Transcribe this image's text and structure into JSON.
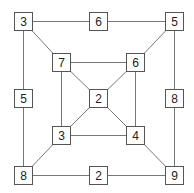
{
  "diagram": {
    "type": "number-graph",
    "line_color": "#777777",
    "nodes": [
      {
        "id": "outer-tl",
        "label": "3",
        "x": 14,
        "y": 12
      },
      {
        "id": "outer-top",
        "label": "6",
        "x": 89,
        "y": 12
      },
      {
        "id": "outer-tr",
        "label": "5",
        "x": 165,
        "y": 12
      },
      {
        "id": "inner-tl",
        "label": "7",
        "x": 52,
        "y": 53
      },
      {
        "id": "inner-tr",
        "label": "6",
        "x": 126,
        "y": 53
      },
      {
        "id": "outer-left",
        "label": "5",
        "x": 14,
        "y": 89
      },
      {
        "id": "center",
        "label": "2",
        "x": 89,
        "y": 89
      },
      {
        "id": "outer-right",
        "label": "8",
        "x": 165,
        "y": 89
      },
      {
        "id": "inner-bl",
        "label": "3",
        "x": 52,
        "y": 126
      },
      {
        "id": "inner-br",
        "label": "4",
        "x": 126,
        "y": 126
      },
      {
        "id": "outer-bl",
        "label": "8",
        "x": 14,
        "y": 166
      },
      {
        "id": "outer-bottom",
        "label": "2",
        "x": 89,
        "y": 166
      },
      {
        "id": "outer-br",
        "label": "9",
        "x": 165,
        "y": 166
      }
    ],
    "edges": [
      [
        "outer-tl",
        "outer-top"
      ],
      [
        "outer-top",
        "outer-tr"
      ],
      [
        "outer-tl",
        "outer-left"
      ],
      [
        "outer-left",
        "outer-bl"
      ],
      [
        "outer-tr",
        "outer-right"
      ],
      [
        "outer-right",
        "outer-br"
      ],
      [
        "outer-bl",
        "outer-bottom"
      ],
      [
        "outer-bottom",
        "outer-br"
      ],
      [
        "outer-tl",
        "inner-tl"
      ],
      [
        "outer-tr",
        "inner-tr"
      ],
      [
        "outer-bl",
        "inner-bl"
      ],
      [
        "outer-br",
        "inner-br"
      ],
      [
        "inner-tl",
        "inner-tr"
      ],
      [
        "inner-tl",
        "inner-bl"
      ],
      [
        "inner-tr",
        "inner-br"
      ],
      [
        "inner-bl",
        "inner-br"
      ],
      [
        "inner-tl",
        "center"
      ],
      [
        "inner-tr",
        "center"
      ],
      [
        "inner-bl",
        "center"
      ],
      [
        "inner-br",
        "center"
      ]
    ]
  }
}
